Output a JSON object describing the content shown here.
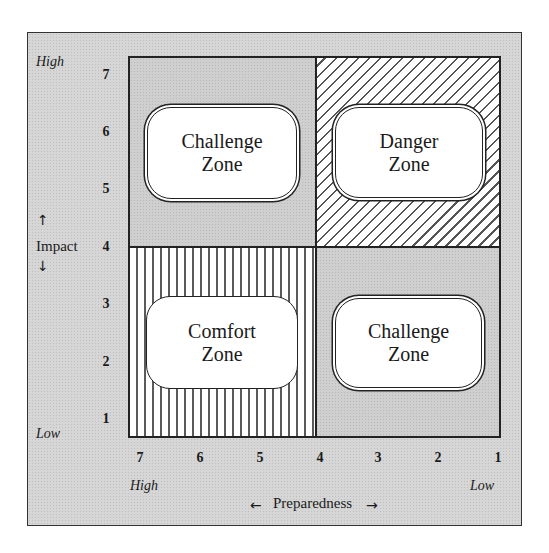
{
  "diagram": {
    "type": "2x2 risk matrix",
    "y_axis": {
      "label": "Impact",
      "arrow_up": "↑",
      "arrow_down": "↓",
      "high_label": "High",
      "low_label": "Low",
      "ticks": [
        "7",
        "6",
        "5",
        "4",
        "3",
        "2",
        "1"
      ]
    },
    "x_axis": {
      "label": "Preparedness",
      "arrow_left": "←",
      "arrow_right": "→",
      "high_label": "High",
      "low_label": "Low",
      "ticks": [
        "7",
        "6",
        "5",
        "4",
        "3",
        "2",
        "1"
      ]
    },
    "quadrants": [
      {
        "position": "top-left",
        "fill": "gray",
        "line1": "Challenge",
        "line2": "Zone",
        "border": "double"
      },
      {
        "position": "top-right",
        "fill": "diagonal-hatch",
        "line1": "Danger",
        "line2": "Zone",
        "border": "double"
      },
      {
        "position": "bottom-left",
        "fill": "vertical-lines",
        "line1": "Comfort",
        "line2": "Zone",
        "border": "single"
      },
      {
        "position": "bottom-right",
        "fill": "gray",
        "line1": "Challenge",
        "line2": "Zone",
        "border": "double"
      }
    ],
    "colors": {
      "background": "#d6d6d6",
      "shaded_quadrant": "#cfcfcf",
      "line": "#222222",
      "zone_fill": "#ffffff"
    }
  }
}
